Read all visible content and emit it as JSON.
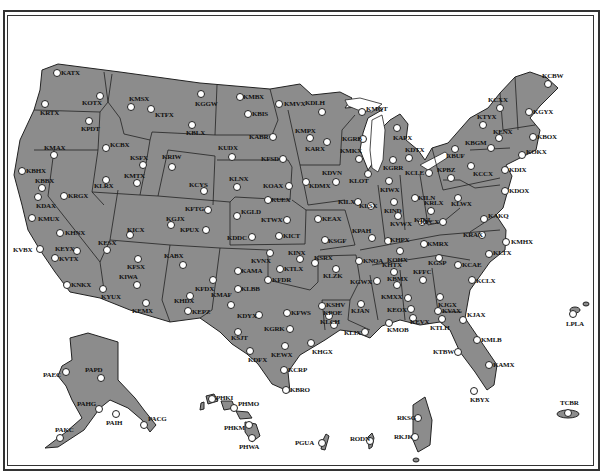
{
  "map": {
    "title": "",
    "colors": {
      "land": "#8c8c8c",
      "water": "#ffffff",
      "border": "#222222",
      "site": "#ffffff"
    },
    "sites": [
      {
        "id": "KATX",
        "x": 57,
        "y": 73,
        "lx": 4,
        "ly": -4
      },
      {
        "id": "KRTX",
        "x": 45,
        "y": 104,
        "lx": -5,
        "ly": 5
      },
      {
        "id": "KOTX",
        "x": 100,
        "y": 96,
        "lx": -18,
        "ly": 3
      },
      {
        "id": "KPDT",
        "x": 89,
        "y": 121,
        "lx": -8,
        "ly": 4
      },
      {
        "id": "KMSX",
        "x": 131,
        "y": 107,
        "lx": -2,
        "ly": -12
      },
      {
        "id": "KTFX",
        "x": 151,
        "y": 109,
        "lx": 4,
        "ly": 2
      },
      {
        "id": "KGGW",
        "x": 201,
        "y": 94,
        "lx": -6,
        "ly": 6
      },
      {
        "id": "KBLX",
        "x": 192,
        "y": 125,
        "lx": -6,
        "ly": 4
      },
      {
        "id": "KCBX",
        "x": 106,
        "y": 148,
        "lx": 4,
        "ly": -7
      },
      {
        "id": "KMAX",
        "x": 54,
        "y": 155,
        "lx": -10,
        "ly": -11
      },
      {
        "id": "KBHX",
        "x": 22,
        "y": 171,
        "lx": 4,
        "ly": -4
      },
      {
        "id": "KBBX",
        "x": 42,
        "y": 188,
        "lx": -7,
        "ly": -11
      },
      {
        "id": "KDAX",
        "x": 38,
        "y": 197,
        "lx": -2,
        "ly": 5
      },
      {
        "id": "KMUX",
        "x": 32,
        "y": 218,
        "lx": 6,
        "ly": -3
      },
      {
        "id": "KRGX",
        "x": 64,
        "y": 196,
        "lx": 4,
        "ly": -4
      },
      {
        "id": "KLRX",
        "x": 106,
        "y": 180,
        "lx": -12,
        "ly": 2
      },
      {
        "id": "KSFX",
        "x": 143,
        "y": 165,
        "lx": -13,
        "ly": -11
      },
      {
        "id": "KMTX",
        "x": 137,
        "y": 183,
        "lx": -13,
        "ly": -11
      },
      {
        "id": "KRIW",
        "x": 172,
        "y": 167,
        "lx": -10,
        "ly": -14
      },
      {
        "id": "KCYS",
        "x": 204,
        "y": 191,
        "lx": -15,
        "ly": -10
      },
      {
        "id": "KFTG",
        "x": 208,
        "y": 210,
        "lx": -23,
        "ly": -5
      },
      {
        "id": "KGJX",
        "x": 171,
        "y": 225,
        "lx": -5,
        "ly": -10
      },
      {
        "id": "KPUX",
        "x": 206,
        "y": 230,
        "lx": -26,
        "ly": -4
      },
      {
        "id": "KICX",
        "x": 130,
        "y": 235,
        "lx": -3,
        "ly": -9
      },
      {
        "id": "KHNX",
        "x": 60,
        "y": 233,
        "lx": 5,
        "ly": -4
      },
      {
        "id": "KESX",
        "x": 107,
        "y": 250,
        "lx": -9,
        "ly": -11
      },
      {
        "id": "KEYX",
        "x": 77,
        "y": 251,
        "lx": -22,
        "ly": -6
      },
      {
        "id": "KVBX",
        "x": 40,
        "y": 249,
        "lx": -27,
        "ly": -3
      },
      {
        "id": "KVTX",
        "x": 55,
        "y": 258,
        "lx": 4,
        "ly": -3
      },
      {
        "id": "KFSX",
        "x": 138,
        "y": 259,
        "lx": -11,
        "ly": 4
      },
      {
        "id": "KIWA",
        "x": 137,
        "y": 285,
        "lx": -18,
        "ly": -12
      },
      {
        "id": "KNKX",
        "x": 67,
        "y": 285,
        "lx": 4,
        "ly": -4
      },
      {
        "id": "KYUX",
        "x": 103,
        "y": 289,
        "lx": -2,
        "ly": 4
      },
      {
        "id": "KEMX",
        "x": 146,
        "y": 303,
        "lx": -14,
        "ly": 4
      },
      {
        "id": "KABX",
        "x": 183,
        "y": 265,
        "lx": -19,
        "ly": -13
      },
      {
        "id": "KFDX",
        "x": 213,
        "y": 280,
        "lx": -18,
        "ly": 5
      },
      {
        "id": "KHDX",
        "x": 190,
        "y": 296,
        "lx": -16,
        "ly": 1
      },
      {
        "id": "KEPZ",
        "x": 188,
        "y": 311,
        "lx": 4,
        "ly": -3
      },
      {
        "id": "KMBX",
        "x": 240,
        "y": 97,
        "lx": 3,
        "ly": -4
      },
      {
        "id": "KBIS",
        "x": 248,
        "y": 114,
        "lx": 4,
        "ly": -4
      },
      {
        "id": "KMVX",
        "x": 279,
        "y": 104,
        "lx": 5,
        "ly": -4
      },
      {
        "id": "KDLH",
        "x": 322,
        "y": 112,
        "lx": -17,
        "ly": -13
      },
      {
        "id": "KABR",
        "x": 273,
        "y": 137,
        "lx": -24,
        "ly": -4
      },
      {
        "id": "KUDX",
        "x": 232,
        "y": 157,
        "lx": -14,
        "ly": -13
      },
      {
        "id": "KFSD",
        "x": 283,
        "y": 159,
        "lx": -22,
        "ly": -4
      },
      {
        "id": "KMPX",
        "x": 310,
        "y": 138,
        "lx": -15,
        "ly": -11
      },
      {
        "id": "KARX",
        "x": 327,
        "y": 142,
        "lx": -22,
        "ly": 3
      },
      {
        "id": "KDVN",
        "x": 336,
        "y": 182,
        "lx": -14,
        "ly": -13
      },
      {
        "id": "KDMX",
        "x": 306,
        "y": 182,
        "lx": 3,
        "ly": 0
      },
      {
        "id": "KLNX",
        "x": 237,
        "y": 187,
        "lx": -8,
        "ly": -12
      },
      {
        "id": "KOAX",
        "x": 289,
        "y": 186,
        "lx": -26,
        "ly": -4
      },
      {
        "id": "KUEX",
        "x": 268,
        "y": 200,
        "lx": 3,
        "ly": -4
      },
      {
        "id": "KGLD",
        "x": 237,
        "y": 216,
        "lx": 4,
        "ly": -8
      },
      {
        "id": "KTWX",
        "x": 287,
        "y": 220,
        "lx": -26,
        "ly": -4
      },
      {
        "id": "KDDC",
        "x": 252,
        "y": 237,
        "lx": -25,
        "ly": -3
      },
      {
        "id": "KICT",
        "x": 279,
        "y": 236,
        "lx": 4,
        "ly": -4
      },
      {
        "id": "KEAX",
        "x": 318,
        "y": 219,
        "lx": 4,
        "ly": -4
      },
      {
        "id": "KMQT",
        "x": 362,
        "y": 112,
        "lx": 4,
        "ly": -7
      },
      {
        "id": "KGRB",
        "x": 363,
        "y": 139,
        "lx": -21,
        "ly": -4
      },
      {
        "id": "KMKX",
        "x": 359,
        "y": 159,
        "lx": -19,
        "ly": -12
      },
      {
        "id": "KLOT",
        "x": 368,
        "y": 174,
        "lx": -19,
        "ly": 3
      },
      {
        "id": "KAPX",
        "x": 397,
        "y": 128,
        "lx": -4,
        "ly": 6
      },
      {
        "id": "KDTX",
        "x": 409,
        "y": 158,
        "lx": -4,
        "ly": -12
      },
      {
        "id": "KGRR",
        "x": 393,
        "y": 160,
        "lx": -10,
        "ly": 4
      },
      {
        "id": "KCLE",
        "x": 429,
        "y": 173,
        "lx": -24,
        "ly": -4
      },
      {
        "id": "KIWX",
        "x": 389,
        "y": 181,
        "lx": -9,
        "ly": 5
      },
      {
        "id": "KILX",
        "x": 358,
        "y": 202,
        "lx": -20,
        "ly": -4
      },
      {
        "id": "KLSX",
        "x": 371,
        "y": 206,
        "lx": -12,
        "ly": -4
      },
      {
        "id": "KIND",
        "x": 394,
        "y": 202,
        "lx": -10,
        "ly": 5
      },
      {
        "id": "KILN",
        "x": 415,
        "y": 198,
        "lx": 3,
        "ly": -4
      },
      {
        "id": "KVWX",
        "x": 398,
        "y": 216,
        "lx": -8,
        "ly": 4
      },
      {
        "id": "KJKL",
        "x": 422,
        "y": 222,
        "lx": -8,
        "ly": -6
      },
      {
        "id": "KRLX",
        "x": 431,
        "y": 211,
        "lx": -7,
        "ly": -12
      },
      {
        "id": "KLWX",
        "x": 458,
        "y": 198,
        "lx": -7,
        "ly": 2
      },
      {
        "id": "KSGF",
        "x": 325,
        "y": 240,
        "lx": 3,
        "ly": -3
      },
      {
        "id": "KPAH",
        "x": 372,
        "y": 238,
        "lx": -20,
        "ly": -11
      },
      {
        "id": "KHPX",
        "x": 388,
        "y": 241,
        "lx": 2,
        "ly": -5
      },
      {
        "id": "KFCX",
        "x": 443,
        "y": 222,
        "lx": -23,
        "ly": -4
      },
      {
        "id": "KMRX",
        "x": 424,
        "y": 244,
        "lx": 3,
        "ly": -4
      },
      {
        "id": "KRAX",
        "x": 482,
        "y": 235,
        "lx": -19,
        "ly": -4
      },
      {
        "id": "KAKQ",
        "x": 484,
        "y": 219,
        "lx": 4,
        "ly": -7
      },
      {
        "id": "KMHX",
        "x": 506,
        "y": 242,
        "lx": 5,
        "ly": -4
      },
      {
        "id": "KLTX",
        "x": 489,
        "y": 254,
        "lx": 4,
        "ly": -5
      },
      {
        "id": "KCAE",
        "x": 458,
        "y": 265,
        "lx": 4,
        "ly": -4
      },
      {
        "id": "KGSP",
        "x": 439,
        "y": 258,
        "lx": -11,
        "ly": 1
      },
      {
        "id": "KCLX",
        "x": 472,
        "y": 280,
        "lx": 4,
        "ly": -3
      },
      {
        "id": "KOHX",
        "x": 400,
        "y": 251,
        "lx": -13,
        "ly": 5
      },
      {
        "id": "KHTX",
        "x": 394,
        "y": 272,
        "lx": -12,
        "ly": -11
      },
      {
        "id": "KFFC",
        "x": 423,
        "y": 280,
        "lx": -10,
        "ly": -12
      },
      {
        "id": "KBMX",
        "x": 397,
        "y": 285,
        "lx": -10,
        "ly": -10
      },
      {
        "id": "KJGX",
        "x": 440,
        "y": 297,
        "lx": -2,
        "ly": 4
      },
      {
        "id": "KMXX",
        "x": 408,
        "y": 298,
        "lx": -27,
        "ly": -5
      },
      {
        "id": "KEOX",
        "x": 411,
        "y": 309,
        "lx": -24,
        "ly": -3
      },
      {
        "id": "KVAX",
        "x": 438,
        "y": 311,
        "lx": 4,
        "ly": -4
      },
      {
        "id": "KTLH",
        "x": 442,
        "y": 319,
        "lx": -12,
        "ly": 5
      },
      {
        "id": "KEVX",
        "x": 413,
        "y": 318,
        "lx": -3,
        "ly": 0
      },
      {
        "id": "KJAX",
        "x": 463,
        "y": 320,
        "lx": 4,
        "ly": -9
      },
      {
        "id": "KMLB",
        "x": 477,
        "y": 340,
        "lx": 4,
        "ly": -4
      },
      {
        "id": "KTBW",
        "x": 458,
        "y": 352,
        "lx": -25,
        "ly": -4
      },
      {
        "id": "KAMX",
        "x": 489,
        "y": 365,
        "lx": 4,
        "ly": -4
      },
      {
        "id": "KBYX",
        "x": 474,
        "y": 391,
        "lx": -4,
        "ly": 5
      },
      {
        "id": "KMOB",
        "x": 389,
        "y": 323,
        "lx": -2,
        "ly": 3
      },
      {
        "id": "KJAN",
        "x": 361,
        "y": 304,
        "lx": -10,
        "ly": 3
      },
      {
        "id": "KLIX",
        "x": 365,
        "y": 332,
        "lx": -21,
        "ly": -3
      },
      {
        "id": "KLCH",
        "x": 334,
        "y": 325,
        "lx": -14,
        "ly": -7
      },
      {
        "id": "KPOE",
        "x": 329,
        "y": 316,
        "lx": -6,
        "ly": -7
      },
      {
        "id": "KSHV",
        "x": 322,
        "y": 306,
        "lx": 4,
        "ly": -5
      },
      {
        "id": "KLZK",
        "x": 336,
        "y": 269,
        "lx": -13,
        "ly": 3
      },
      {
        "id": "KSRX",
        "x": 315,
        "y": 263,
        "lx": -1,
        "ly": -9
      },
      {
        "id": "KNQA",
        "x": 359,
        "y": 261,
        "lx": 4,
        "ly": -4
      },
      {
        "id": "KGWX",
        "x": 377,
        "y": 281,
        "lx": -27,
        "ly": -3
      },
      {
        "id": "KINX",
        "x": 300,
        "y": 259,
        "lx": -12,
        "ly": -10
      },
      {
        "id": "KVNX",
        "x": 270,
        "y": 253,
        "lx": -19,
        "ly": 4
      },
      {
        "id": "KTLX",
        "x": 280,
        "y": 269,
        "lx": 4,
        "ly": -4
      },
      {
        "id": "KFDR",
        "x": 268,
        "y": 280,
        "lx": 4,
        "ly": -4
      },
      {
        "id": "KAMA",
        "x": 238,
        "y": 271,
        "lx": 3,
        "ly": -4
      },
      {
        "id": "KLBB",
        "x": 238,
        "y": 289,
        "lx": 3,
        "ly": -4
      },
      {
        "id": "KMAF",
        "x": 231,
        "y": 305,
        "lx": -20,
        "ly": -14
      },
      {
        "id": "KDYX",
        "x": 259,
        "y": 315,
        "lx": -22,
        "ly": -3
      },
      {
        "id": "KFWS",
        "x": 287,
        "y": 313,
        "lx": 4,
        "ly": -4
      },
      {
        "id": "KSJT",
        "x": 238,
        "y": 332,
        "lx": -7,
        "ly": 2
      },
      {
        "id": "KGRK",
        "x": 290,
        "y": 329,
        "lx": -26,
        "ly": -4
      },
      {
        "id": "KDFX",
        "x": 250,
        "y": 351,
        "lx": -2,
        "ly": 5
      },
      {
        "id": "KEWX",
        "x": 285,
        "y": 346,
        "lx": -14,
        "ly": 5
      },
      {
        "id": "KHGX",
        "x": 311,
        "y": 343,
        "lx": 1,
        "ly": 5
      },
      {
        "id": "KCRP",
        "x": 284,
        "y": 370,
        "lx": 4,
        "ly": -4
      },
      {
        "id": "KBRO",
        "x": 286,
        "y": 390,
        "lx": 4,
        "ly": -4
      },
      {
        "id": "KCBW",
        "x": 548,
        "y": 84,
        "lx": -6,
        "ly": -12
      },
      {
        "id": "KCXX",
        "x": 500,
        "y": 108,
        "lx": -12,
        "ly": -12
      },
      {
        "id": "KGYX",
        "x": 529,
        "y": 112,
        "lx": 4,
        "ly": -4
      },
      {
        "id": "KTYX",
        "x": 483,
        "y": 125,
        "lx": -6,
        "ly": -12
      },
      {
        "id": "KENX",
        "x": 499,
        "y": 138,
        "lx": -6,
        "ly": -10
      },
      {
        "id": "KBOX",
        "x": 533,
        "y": 137,
        "lx": 4,
        "ly": -4
      },
      {
        "id": "KBGM",
        "x": 491,
        "y": 148,
        "lx": -26,
        "ly": -9
      },
      {
        "id": "KOKX",
        "x": 522,
        "y": 155,
        "lx": 4,
        "ly": -7
      },
      {
        "id": "KBUF",
        "x": 455,
        "y": 149,
        "lx": -9,
        "ly": 3
      },
      {
        "id": "KPBZ",
        "x": 451,
        "y": 178,
        "lx": -14,
        "ly": -12
      },
      {
        "id": "KCCX",
        "x": 471,
        "y": 166,
        "lx": 2,
        "ly": 4
      },
      {
        "id": "KDIX",
        "x": 505,
        "y": 170,
        "lx": 4,
        "ly": -4
      },
      {
        "id": "KDOX",
        "x": 505,
        "y": 191,
        "lx": 4,
        "ly": -4
      },
      {
        "id": "LPLA",
        "x": 573,
        "y": 314,
        "lx": -7,
        "ly": 6
      },
      {
        "id": "TCBR",
        "x": 568,
        "y": 413,
        "lx": -8,
        "ly": -14
      },
      {
        "id": "PAEC",
        "x": 66,
        "y": 372,
        "lx": -23,
        "ly": -1
      },
      {
        "id": "PAPD",
        "x": 101,
        "y": 378,
        "lx": -16,
        "ly": -12
      },
      {
        "id": "PAHG",
        "x": 99,
        "y": 409,
        "lx": -22,
        "ly": -9
      },
      {
        "id": "PAIH",
        "x": 116,
        "y": 414,
        "lx": -10,
        "ly": 5
      },
      {
        "id": "PACG",
        "x": 144,
        "y": 425,
        "lx": 4,
        "ly": -10
      },
      {
        "id": "PAKC",
        "x": 60,
        "y": 438,
        "lx": -5,
        "ly": -12
      },
      {
        "id": "PHKI",
        "x": 212,
        "y": 399,
        "lx": 4,
        "ly": -5
      },
      {
        "id": "PHMO",
        "x": 234,
        "y": 408,
        "lx": 4,
        "ly": -8
      },
      {
        "id": "PHKM",
        "x": 249,
        "y": 425,
        "lx": -25,
        "ly": -1
      },
      {
        "id": "PHWA",
        "x": 252,
        "y": 438,
        "lx": -13,
        "ly": 5
      },
      {
        "id": "PGUA",
        "x": 322,
        "y": 443,
        "lx": -27,
        "ly": -4
      },
      {
        "id": "RODN",
        "x": 370,
        "y": 441,
        "lx": -20,
        "ly": -6
      },
      {
        "id": "RKSG",
        "x": 418,
        "y": 418,
        "lx": -21,
        "ly": -4
      },
      {
        "id": "RKJK",
        "x": 415,
        "y": 437,
        "lx": -21,
        "ly": -4
      }
    ]
  }
}
